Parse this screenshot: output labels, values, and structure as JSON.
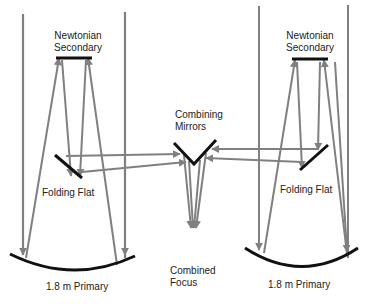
{
  "diagram": {
    "colors": {
      "background": "#ffffff",
      "ray": "#808080",
      "tube": "#7a7a7a",
      "mirror": "#111111",
      "text": "#222222"
    },
    "labels": {
      "left_secondary_line1": "Newtonian",
      "left_secondary_line2": "Secondary",
      "right_secondary_line1": "Newtonian",
      "right_secondary_line2": "Secondary",
      "combining_line1": "Combining",
      "combining_line2": "Mirrors",
      "left_folding_flat": "Folding Flat",
      "right_folding_flat": "Folding Flat",
      "combined_line1": "Combined",
      "combined_line2": "Focus",
      "left_primary": "1.8 m Primary",
      "right_primary": "1.8 m Primary"
    },
    "components": [
      {
        "id": "left-telescope",
        "parts": [
          "tube",
          "newtonian-secondary",
          "folding-flat",
          "primary-mirror"
        ]
      },
      {
        "id": "combining-mirrors",
        "shape": "V"
      },
      {
        "id": "combined-focus"
      },
      {
        "id": "right-telescope",
        "parts": [
          "tube",
          "newtonian-secondary",
          "folding-flat",
          "primary-mirror"
        ]
      }
    ]
  }
}
